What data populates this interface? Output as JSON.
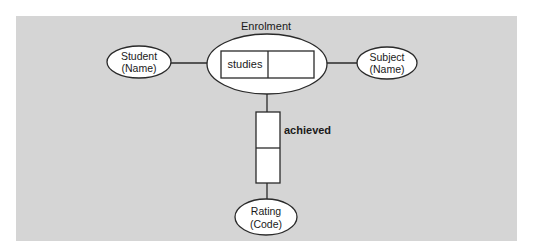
{
  "diagram": {
    "type": "entity-relationship (object-role) diagram",
    "background_color": "#d5d5d5",
    "stroke_color": "#2a2a2a",
    "fill_color": "#ffffff",
    "nested_fact": {
      "label": "Enrolment",
      "fact_roles": [
        "studies",
        ""
      ]
    },
    "entities": [
      {
        "id": "student",
        "line1": "Student",
        "line2": "(Name)"
      },
      {
        "id": "subject",
        "line1": "Subject",
        "line2": "(Name)"
      },
      {
        "id": "rating",
        "line1": "Rating",
        "line2": "(Code)"
      }
    ],
    "fact_types": [
      {
        "id": "studies",
        "label": "studies",
        "roles": 2,
        "orientation": "horizontal",
        "players": [
          "student",
          "subject"
        ]
      },
      {
        "id": "achieved",
        "label": "achieved",
        "roles": 2,
        "orientation": "vertical",
        "players": [
          "enrolment",
          "rating"
        ]
      }
    ]
  }
}
